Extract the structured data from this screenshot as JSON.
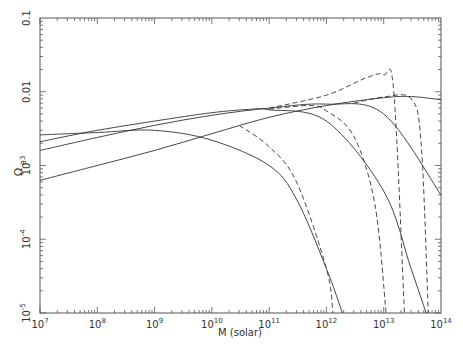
{
  "chart_data": {
    "type": "line",
    "title": "",
    "xlabel": "M (solar)",
    "ylabel": "Ω_B",
    "xscale": "log",
    "yscale": "log",
    "xlim": [
      10000000.0,
      100000000000000.0
    ],
    "ylim": [
      1e-05,
      0.1
    ],
    "grid": false,
    "legend": null,
    "x_tick_labels": [
      "10^7",
      "10^8",
      "10^9",
      "10^10",
      "10^11",
      "10^12",
      "10^13",
      "10^14"
    ],
    "y_tick_labels": [
      "10^-5",
      "10^-4",
      "10^-3",
      "0.01",
      "0.1"
    ],
    "series": [
      {
        "name": "solid-1",
        "style": "solid",
        "points": [
          [
            10000000.0,
            0.0026
          ],
          [
            100000000.0,
            0.0028
          ],
          [
            1000000000.0,
            0.003
          ],
          [
            10000000000.0,
            0.0022
          ],
          [
            100000000000.0,
            0.001
          ],
          [
            300000000000.0,
            0.00035
          ],
          [
            1000000000000.0,
            4e-05
          ],
          [
            1900000000000.0,
            1e-05
          ]
        ]
      },
      {
        "name": "solid-2",
        "style": "solid",
        "points": [
          [
            10000000.0,
            0.0021
          ],
          [
            100000000.0,
            0.003
          ],
          [
            1000000000.0,
            0.004
          ],
          [
            10000000000.0,
            0.0052
          ],
          [
            50000000000.0,
            0.0058
          ],
          [
            100000000000.0,
            0.0057
          ],
          [
            1000000000000.0,
            0.004
          ],
          [
            10000000000000.0,
            0.00045
          ],
          [
            30000000000000.0,
            4e-05
          ],
          [
            55000000000000.0,
            1e-05
          ]
        ]
      },
      {
        "name": "solid-3",
        "style": "solid",
        "points": [
          [
            10000000.0,
            0.0016
          ],
          [
            100000000.0,
            0.0024
          ],
          [
            1000000000.0,
            0.0035
          ],
          [
            10000000000.0,
            0.0048
          ],
          [
            100000000000.0,
            0.006
          ],
          [
            1000000000000.0,
            0.0068
          ],
          [
            10000000000000.0,
            0.005
          ],
          [
            100000000000000.0,
            0.0004
          ]
        ]
      },
      {
        "name": "solid-4",
        "style": "solid",
        "points": [
          [
            10000000.0,
            0.00063
          ],
          [
            100000000.0,
            0.001
          ],
          [
            1000000000.0,
            0.0016
          ],
          [
            10000000000.0,
            0.0027
          ],
          [
            100000000000.0,
            0.0045
          ],
          [
            1000000000000.0,
            0.0065
          ],
          [
            10000000000000.0,
            0.0083
          ],
          [
            30000000000000.0,
            0.0086
          ],
          [
            100000000000000.0,
            0.0078
          ]
        ]
      },
      {
        "name": "dashed-1",
        "style": "dashed",
        "points": [
          [
            30000000000.0,
            0.0035
          ],
          [
            100000000000.0,
            0.0018
          ],
          [
            300000000000.0,
            0.0006
          ],
          [
            1000000000000.0,
            4e-05
          ],
          [
            1300000000000.0,
            1e-05
          ]
        ]
      },
      {
        "name": "dashed-2",
        "style": "dashed",
        "points": [
          [
            100000000000.0,
            0.0058
          ],
          [
            500000000000.0,
            0.0065
          ],
          [
            1000000000000.0,
            0.0055
          ],
          [
            3000000000000.0,
            0.0025
          ],
          [
            7000000000000.0,
            0.0003
          ],
          [
            11000000000000.0,
            1e-05
          ]
        ]
      },
      {
        "name": "dashed-3",
        "style": "dashed",
        "points": [
          [
            100000000000.0,
            0.006
          ],
          [
            1000000000000.0,
            0.009
          ],
          [
            5000000000000.0,
            0.0155
          ],
          [
            10000000000000.0,
            0.017
          ],
          [
            15000000000000.0,
            0.01
          ],
          [
            23000000000000.0,
            1e-05
          ]
        ]
      },
      {
        "name": "dashed-4",
        "style": "dashed",
        "points": [
          [
            3000000000000.0,
            0.007
          ],
          [
            10000000000000.0,
            0.0085
          ],
          [
            30000000000000.0,
            0.008
          ],
          [
            45000000000000.0,
            0.002
          ],
          [
            60000000000000.0,
            1e-05
          ]
        ]
      }
    ]
  },
  "axes": {
    "xlabel": "M (solar)",
    "ylabel_main": "Ω",
    "ylabel_sub": "B"
  }
}
